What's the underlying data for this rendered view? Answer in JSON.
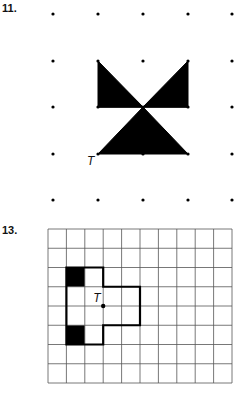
{
  "problems": [
    {
      "number": "11.",
      "type": "dot-grid",
      "dot_columns_x": [
        53,
        98,
        143,
        188,
        232
      ],
      "dot_rows_y": [
        14,
        61,
        107,
        154,
        200
      ],
      "shapes": [
        {
          "name": "upper-left-triangle",
          "points": [
            [
              98,
              61
            ],
            [
              98,
              107
            ],
            [
              143,
              107
            ]
          ],
          "fill": "#000000"
        },
        {
          "name": "upper-right-triangle",
          "points": [
            [
              188,
              61
            ],
            [
              188,
              107
            ],
            [
              143,
              107
            ]
          ],
          "fill": "#000000"
        },
        {
          "name": "lower-triangle",
          "points": [
            [
              143,
              107
            ],
            [
              98,
              154
            ],
            [
              188,
              154
            ]
          ],
          "fill": "#000000"
        }
      ],
      "center_label": {
        "text": "T",
        "x": 87,
        "y": 165
      }
    },
    {
      "number": "13.",
      "type": "square-grid",
      "grid": {
        "x": 48,
        "y": 229,
        "cols": 10,
        "rows": 8,
        "cell_w": 18.4,
        "cell_h": 19.25
      },
      "outline_cells": "cross-shape polygon",
      "outline": [
        [
          1,
          2
        ],
        [
          3,
          2
        ],
        [
          3,
          3
        ],
        [
          5,
          3
        ],
        [
          5,
          5
        ],
        [
          3,
          5
        ],
        [
          3,
          6
        ],
        [
          1,
          6
        ]
      ],
      "black_cells": [
        [
          1,
          2
        ],
        [
          1,
          5
        ]
      ],
      "center_point": {
        "col": 3,
        "row": 4
      },
      "center_label": {
        "text": "T"
      }
    }
  ],
  "colors": {
    "ink": "#000000",
    "grid_line": "#555555",
    "background": "#ffffff"
  }
}
